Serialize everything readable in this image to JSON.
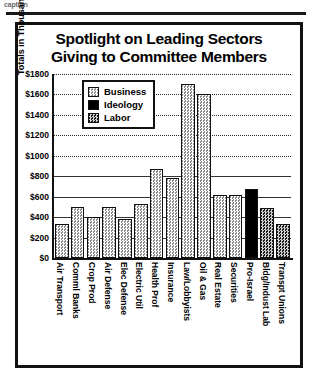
{
  "scan": {
    "caption_fragment": "caption"
  },
  "chart_data": {
    "type": "bar",
    "title": "Spotlight on Leading Sectors Giving to Committee Members",
    "title_line1": "Spotlight on Leading Sectors",
    "title_line2": "Giving to Committee Members",
    "xlabel": "",
    "ylabel": "Totals in Thousands of Dollars",
    "ylim": [
      0,
      1800
    ],
    "ytick_values": [
      0,
      200,
      400,
      600,
      800,
      1000,
      1200,
      1400,
      1600,
      1800
    ],
    "ytick_labels": [
      "$0",
      "$200",
      "$400",
      "$600",
      "$800",
      "$1000",
      "$1200",
      "$1400",
      "$1600",
      "$1800"
    ],
    "grid": true,
    "legend_position": "upper left",
    "legend": [
      {
        "name": "Business",
        "color": "#d4d4d4"
      },
      {
        "name": "Ideology",
        "color": "#000000"
      },
      {
        "name": "Labor",
        "color": "#6e6e6e"
      }
    ],
    "categories": [
      "Air Transport",
      "Comml Banks",
      "Crop Prod",
      "Air Defense",
      "Elec Defense",
      "Electric Util",
      "Health Prof",
      "Insurance",
      "Law/Lobbyists",
      "Oil & Gas",
      "Real Estate",
      "Securities",
      "Pro-Israel",
      "Bldg/Indust Lab",
      "Transpt Unions"
    ],
    "values": [
      330,
      500,
      400,
      500,
      380,
      530,
      870,
      780,
      1700,
      1600,
      620,
      620,
      680,
      490,
      330
    ],
    "groups": [
      "Business",
      "Business",
      "Business",
      "Business",
      "Business",
      "Business",
      "Business",
      "Business",
      "Business",
      "Business",
      "Business",
      "Business",
      "Ideology",
      "Labor",
      "Labor"
    ]
  }
}
